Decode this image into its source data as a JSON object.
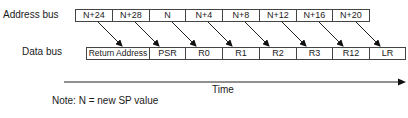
{
  "labels": {
    "address_bus": "Address bus",
    "data_bus": "Data bus",
    "time": "Time",
    "note": "Note: N = new SP value"
  },
  "address_bus": [
    "N+24",
    "N+28",
    "N",
    "N+4",
    "N+8",
    "N+12",
    "N+16",
    "N+20"
  ],
  "data_bus": [
    "Return Address",
    "PSR",
    "R0",
    "R1",
    "R2",
    "R3",
    "R12",
    "LR"
  ],
  "mapping": [
    {
      "address": "N+24",
      "data": "Return Address"
    },
    {
      "address": "N+28",
      "data": "PSR"
    },
    {
      "address": "N",
      "data": "R0"
    },
    {
      "address": "N+4",
      "data": "R1"
    },
    {
      "address": "N+8",
      "data": "R2"
    },
    {
      "address": "N+12",
      "data": "R3"
    },
    {
      "address": "N+16",
      "data": "R12"
    },
    {
      "address": "N+20",
      "data": "LR"
    }
  ]
}
